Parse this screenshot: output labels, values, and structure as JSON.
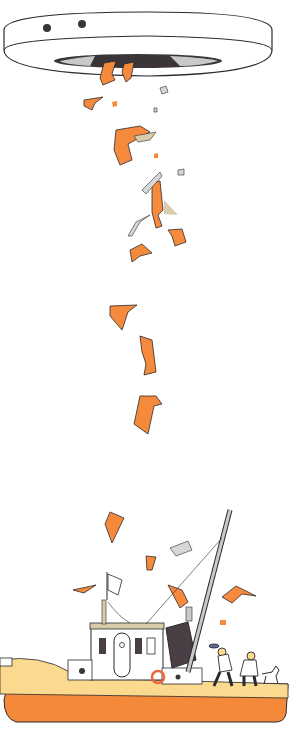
{
  "scene": {
    "title": "",
    "description": "Flying saucer dropping orange fragments onto a fishing boat with two sailors and a dog",
    "colors": {
      "background": "#ffffff",
      "orange": "#f58a3c",
      "hull_orange": "#f5893a",
      "deck_cream": "#fbd98e",
      "outline": "#2b2a2e",
      "ufo_white": "#ffffff",
      "ufo_dark": "#3b3539",
      "ufo_grey": "#c9c9cc",
      "funnel": "#4a3f44",
      "tan": "#d9ccaa",
      "lifebuoy": "#e86a3a"
    }
  }
}
